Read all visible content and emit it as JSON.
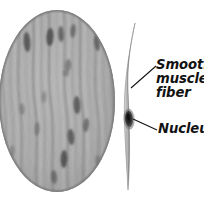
{
  "figure": {
    "background_color": "#ffffff",
    "ink_color": "#121212"
  },
  "panels": {
    "tissue_section": {
      "name": "smooth-muscle-tissue-section",
      "shape": "oval",
      "description": "Oval micrograph of smooth muscle tissue showing densely packed wavy vertical fibers with scattered dark elongated nuclei",
      "fill_tone": "#a9a9a9",
      "border_tone": "#7c7c7c",
      "fiber_count": 22,
      "nuclei_count": 17
    },
    "isolated_fiber": {
      "name": "isolated-smooth-muscle-fiber",
      "shape": "spindle",
      "description": "Single tapered spindle-shaped smooth muscle fiber with a central dark nucleus",
      "fill_tone": "#9e9e9e",
      "nucleus_tone": "#2b2b2b"
    }
  },
  "labels": {
    "smooth_muscle_fiber": {
      "lines": [
        "Smooth",
        "muscle",
        "fiber"
      ],
      "text": "Smooth muscle fiber"
    },
    "nucleus": {
      "text": "Nucleus"
    }
  },
  "leaders": {
    "smooth_muscle_fiber": {
      "from_x": 131,
      "from_y": 88,
      "to_x": 156,
      "to_y": 66
    },
    "nucleus": {
      "from_x": 133,
      "from_y": 119,
      "to_x": 157,
      "to_y": 130
    }
  }
}
